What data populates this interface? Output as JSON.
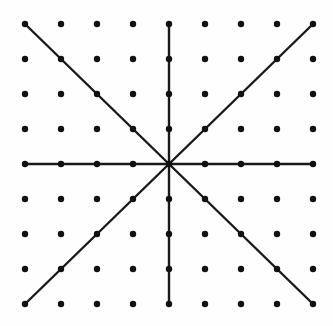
{
  "figure": {
    "background_color": "#fefefe",
    "dot_color": "#111111",
    "line_color": "#1a1a1a",
    "width": 333,
    "height": 326
  },
  "chart_data": {
    "type": "scatter",
    "xlabel": "",
    "ylabel": "",
    "grid": false,
    "legend": null,
    "xlim": [
      0,
      8
    ],
    "ylim": [
      0,
      8
    ],
    "lattice": {
      "columns": 9,
      "rows": 9,
      "origin_x": 25,
      "origin_y": 24,
      "step_x": 36,
      "step_y": 35,
      "dot_radius": 3.2,
      "dot_count": 81,
      "x_indices": [
        0,
        1,
        2,
        3,
        4,
        5,
        6,
        7,
        8
      ],
      "y_indices": [
        0,
        1,
        2,
        3,
        4,
        5,
        6,
        7,
        8
      ],
      "x_pixel_positions": [
        25,
        61,
        97,
        133,
        169,
        205,
        241,
        277,
        313
      ],
      "y_pixel_positions": [
        24,
        59,
        94,
        129,
        164,
        199,
        234,
        269,
        304
      ]
    },
    "center_point": {
      "col": 4,
      "row": 4,
      "x": 169,
      "y": 164
    },
    "line_width": 2.4,
    "lines": [
      {
        "name": "horizontal",
        "from": {
          "col": 0,
          "row": 4
        },
        "to": {
          "col": 8,
          "row": 4
        },
        "angle_deg": 0
      },
      {
        "name": "vertical",
        "from": {
          "col": 4,
          "row": 0
        },
        "to": {
          "col": 4,
          "row": 8
        },
        "angle_deg": 90
      },
      {
        "name": "diagonal-nw-se",
        "from": {
          "col": 0,
          "row": 0
        },
        "to": {
          "col": 8,
          "row": 8
        },
        "angle_deg": 135
      },
      {
        "name": "diagonal-sw-ne",
        "from": {
          "col": 0,
          "row": 8
        },
        "to": {
          "col": 8,
          "row": 0
        },
        "angle_deg": 45
      }
    ],
    "rays": [
      {
        "name": "ray-east",
        "direction": [
          1,
          0
        ],
        "end": {
          "col": 8,
          "row": 4
        }
      },
      {
        "name": "ray-west",
        "direction": [
          -1,
          0
        ],
        "end": {
          "col": 0,
          "row": 4
        }
      },
      {
        "name": "ray-north",
        "direction": [
          0,
          -1
        ],
        "end": {
          "col": 4,
          "row": 0
        }
      },
      {
        "name": "ray-south",
        "direction": [
          0,
          1
        ],
        "end": {
          "col": 4,
          "row": 8
        }
      },
      {
        "name": "ray-northeast",
        "direction": [
          1,
          -1
        ],
        "end": {
          "col": 8,
          "row": 0
        }
      },
      {
        "name": "ray-northwest",
        "direction": [
          -1,
          -1
        ],
        "end": {
          "col": 0,
          "row": 0
        }
      },
      {
        "name": "ray-southeast",
        "direction": [
          1,
          1
        ],
        "end": {
          "col": 8,
          "row": 8
        }
      },
      {
        "name": "ray-southwest",
        "direction": [
          -1,
          1
        ],
        "end": {
          "col": 0,
          "row": 8
        }
      }
    ]
  }
}
